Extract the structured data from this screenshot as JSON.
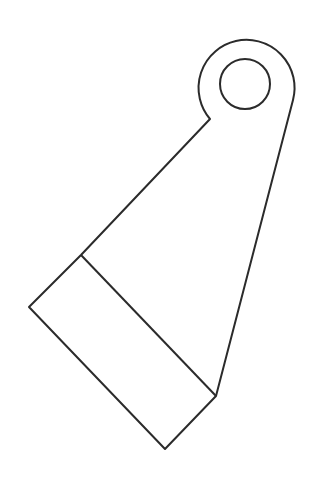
{
  "diagram": {
    "title": "",
    "stroke_color": "#2b2b2b",
    "background": "#ffffff",
    "shapes": {
      "outline_path": "M 210 119 A 48 48 0 1 1 293 100 L 216 396 L 165 449 L 29 307 L 81 255 Z",
      "band_line": {
        "x1": 81,
        "y1": 255,
        "x2": 216,
        "y2": 396
      },
      "hole": {
        "cx": 245,
        "cy": 84,
        "r": 25
      }
    }
  }
}
